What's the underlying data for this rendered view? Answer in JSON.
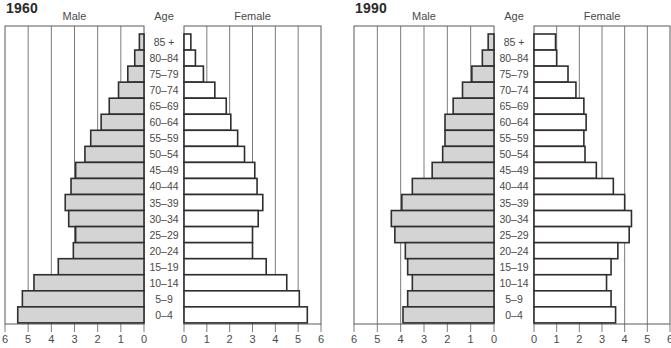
{
  "chart_data": [
    {
      "type": "bar",
      "subtype": "population-pyramid",
      "title": "1960",
      "left_label": "Male",
      "center_label": "Age",
      "right_label": "Female",
      "categories": [
        "85+",
        "80-84",
        "75-79",
        "70-74",
        "65-69",
        "60-64",
        "55-59",
        "50-54",
        "45-49",
        "40-44",
        "35-39",
        "30-34",
        "25-29",
        "20-24",
        "15-19",
        "10-14",
        "5-9",
        "0-4"
      ],
      "category_labels": [
        "85 +",
        "80–84",
        "75–79",
        "70–74",
        "65–69",
        "60–64",
        "55–59",
        "50–54",
        "45–49",
        "40–44",
        "35–39",
        "30–34",
        "25–29",
        "20–24",
        "15–19",
        "10–14",
        "5–9",
        "0–4"
      ],
      "series": [
        {
          "name": "Male",
          "color": "#d4d4d4",
          "values": [
            0.2,
            0.4,
            0.7,
            1.1,
            1.5,
            1.85,
            2.3,
            2.55,
            2.95,
            3.15,
            3.4,
            3.25,
            2.95,
            3.05,
            3.7,
            4.75,
            5.25,
            5.45
          ]
        },
        {
          "name": "Female",
          "color": "#ffffff",
          "values": [
            0.3,
            0.5,
            0.85,
            1.35,
            1.85,
            2.05,
            2.35,
            2.65,
            3.1,
            3.2,
            3.45,
            3.25,
            3.0,
            3.0,
            3.6,
            4.5,
            5.05,
            5.4
          ]
        }
      ],
      "xlabel": "",
      "ylabel": "Age",
      "xlim": [
        0,
        6
      ],
      "xticks_left": [
        "6",
        "5",
        "4",
        "3",
        "2",
        "1",
        "0"
      ],
      "xticks_right": [
        "0",
        "1",
        "2",
        "3",
        "4",
        "5",
        "6"
      ],
      "grid": true
    },
    {
      "type": "bar",
      "subtype": "population-pyramid",
      "title": "1990",
      "left_label": "Male",
      "center_label": "Age",
      "right_label": "Female",
      "categories": [
        "85+",
        "80-84",
        "75-79",
        "70-74",
        "65-69",
        "60-64",
        "55-59",
        "50-54",
        "45-49",
        "40-44",
        "35-39",
        "30-34",
        "25-29",
        "20-24",
        "15-19",
        "10-14",
        "5-9",
        "0-4"
      ],
      "category_labels": [
        "85 +",
        "80–84",
        "75–79",
        "70–74",
        "65–69",
        "60–64",
        "55–59",
        "50–54",
        "45–49",
        "40–44",
        "35–39",
        "30–34",
        "25–29",
        "20–24",
        "15–19",
        "10–14",
        "5–9",
        "0–4"
      ],
      "series": [
        {
          "name": "Male",
          "color": "#d4d4d4",
          "values": [
            0.25,
            0.5,
            0.95,
            1.35,
            1.75,
            2.1,
            2.1,
            2.2,
            2.65,
            3.5,
            3.95,
            4.4,
            4.25,
            3.8,
            3.7,
            3.5,
            3.7,
            3.9
          ]
        },
        {
          "name": "Female",
          "color": "#ffffff",
          "values": [
            0.95,
            1.0,
            1.5,
            1.85,
            2.2,
            2.3,
            2.2,
            2.25,
            2.75,
            3.5,
            4.0,
            4.3,
            4.2,
            3.7,
            3.4,
            3.2,
            3.4,
            3.6
          ]
        }
      ],
      "xlabel": "",
      "ylabel": "Age",
      "xlim": [
        0,
        6
      ],
      "xticks_left": [
        "6",
        "5",
        "4",
        "3",
        "2",
        "1",
        "0"
      ],
      "xticks_right": [
        "0",
        "1",
        "2",
        "3",
        "4",
        "5",
        "6"
      ],
      "grid": true
    }
  ],
  "style": {
    "male_fill": "#d4d4d4",
    "female_fill": "#ffffff",
    "bar_stroke": "#2e2e2e",
    "grid_color": "#5a5a5a",
    "frame_color": "#5a5a5a",
    "text_color": "#4a4a4a",
    "title_color": "#2b2b2b"
  }
}
